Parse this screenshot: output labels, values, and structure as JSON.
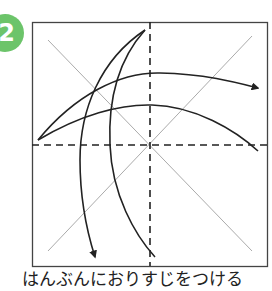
{
  "step": {
    "number": "2",
    "badge_color": "#6cc46a"
  },
  "instruction": "はんぶんにおりすじをつける",
  "diagram": {
    "square_border_color": "#333333",
    "crease_color": "#9a9a9a",
    "arrow_color": "#222222",
    "fold_lines": [
      "vertical-valley-fold",
      "horizontal-valley-fold"
    ],
    "arrows": [
      "top-arc-right",
      "lower-arc-right",
      "left-arc-down",
      "right-arc-down"
    ]
  }
}
